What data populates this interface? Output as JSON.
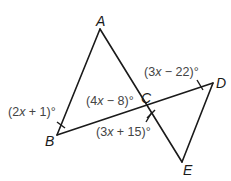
{
  "diagram": {
    "vertices": {
      "A": {
        "label": "A",
        "x": 100,
        "y": 29
      },
      "B": {
        "label": "B",
        "x": 57,
        "y": 135
      },
      "C": {
        "label": "C",
        "x": 148,
        "y": 106
      },
      "D": {
        "label": "D",
        "x": 213,
        "y": 83
      },
      "E": {
        "label": "E",
        "x": 182,
        "y": 162
      }
    },
    "segments": [
      {
        "from": "A",
        "to": "B"
      },
      {
        "from": "A",
        "to": "E"
      },
      {
        "from": "B",
        "to": "D"
      },
      {
        "from": "D",
        "to": "E"
      }
    ],
    "angles": {
      "B": {
        "expr_pre": "(2",
        "var": "x",
        "expr_post": " + 1)°",
        "full": "(2x + 1)°"
      },
      "ACB": {
        "expr_pre": "(4",
        "var": "x",
        "expr_post": " − 8)°",
        "full": "(4x − 8)°"
      },
      "DCE": {
        "expr_pre": "(3",
        "var": "x",
        "expr_post": " + 15)°",
        "full": "(3x + 15)°"
      },
      "D": {
        "expr_pre": "(3",
        "var": "x",
        "expr_post": " − 22)°",
        "full": "(3x − 22)°"
      }
    },
    "colors": {
      "line": "#1a1a1a",
      "angle_text": "#444444",
      "background": "#ffffff"
    }
  }
}
